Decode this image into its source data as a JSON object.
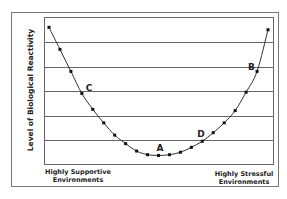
{
  "chart_data": {
    "type": "line",
    "title": "",
    "xlabel": "",
    "ylabel": "Level of Biological Reactivity",
    "x_axis_left_label": [
      "Highly Supportive",
      "Environments"
    ],
    "x_axis_right_label": [
      "Highly Stressful",
      "Environments"
    ],
    "ylim": [
      0,
      6
    ],
    "xlim": [
      0,
      20
    ],
    "grid": true,
    "gridlines_y": [
      1,
      2,
      3,
      4,
      5
    ],
    "legend": "none",
    "series": [
      {
        "name": "Biological reactivity curve",
        "marker": "square",
        "color": "#111111",
        "x": [
          0,
          1,
          2,
          3,
          4,
          5,
          6,
          7,
          8,
          9,
          10,
          11,
          12,
          13,
          14,
          15,
          16,
          17,
          18,
          19,
          20
        ],
        "y": [
          5.6,
          4.7,
          3.8,
          2.9,
          2.25,
          1.7,
          1.2,
          0.85,
          0.55,
          0.4,
          0.37,
          0.4,
          0.5,
          0.7,
          0.95,
          1.3,
          1.7,
          2.2,
          2.95,
          3.8,
          5.5
        ]
      }
    ],
    "annotations": [
      {
        "label": "C",
        "x": 3,
        "y": 2.9
      },
      {
        "label": "A",
        "x": 10,
        "y": 0.37
      },
      {
        "label": "D",
        "x": 14,
        "y": 0.95
      },
      {
        "label": "B",
        "x": 19,
        "y": 3.8
      }
    ]
  }
}
